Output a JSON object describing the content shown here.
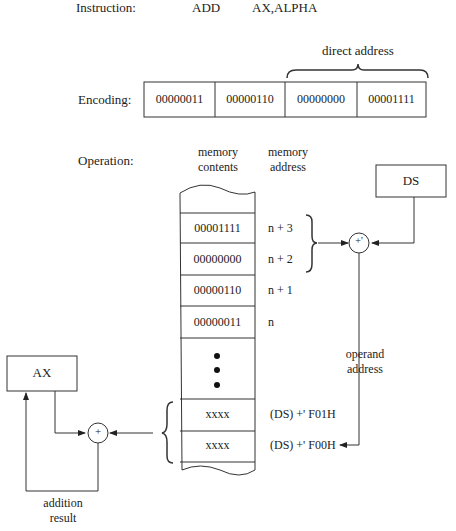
{
  "instruction": {
    "label": "Instruction:",
    "mnemonic": "ADD",
    "operands": "AX,ALPHA"
  },
  "encoding": {
    "label": "Encoding:",
    "brace_label": "direct address",
    "bytes": [
      "00000011",
      "00000110",
      "00000000",
      "00001111"
    ]
  },
  "operation": {
    "label": "Operation:",
    "col_contents": [
      "memory",
      "contents"
    ],
    "col_address": [
      "memory",
      "address"
    ],
    "cells": [
      {
        "content": "00001111",
        "address": "n + 3"
      },
      {
        "content": "00000000",
        "address": "n + 2"
      },
      {
        "content": "00000110",
        "address": "n + 1"
      },
      {
        "content": "00000011",
        "address": "n"
      },
      {
        "content": "xxxx",
        "address": "(DS) +' F01H"
      },
      {
        "content": "xxxx",
        "address": "(DS) +' F00H"
      }
    ],
    "ds_register": "DS",
    "ax_register": "AX",
    "adder_ds": "+'",
    "adder_ax": "+",
    "operand_address": [
      "operand",
      "address"
    ],
    "addition_result": [
      "addition",
      "result"
    ]
  }
}
